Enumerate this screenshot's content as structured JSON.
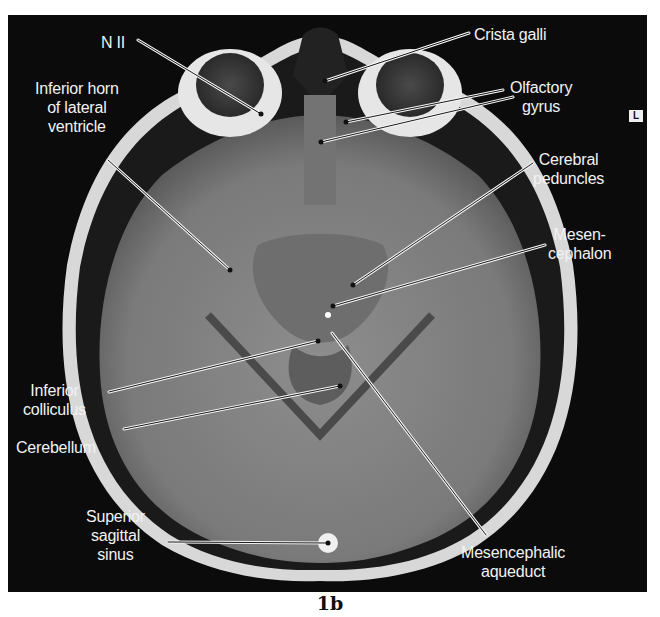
{
  "figure": {
    "caption": "1b",
    "orientation_marker": "L",
    "image_type": "axial MRI section of head"
  },
  "labels": [
    {
      "id": "n2",
      "text": "N II"
    },
    {
      "id": "crista-galli",
      "text": "Crista galli"
    },
    {
      "id": "inferior-horn",
      "text": "Inferior horn\nof lateral\nventricle"
    },
    {
      "id": "olfactory-gyrus",
      "text": "Olfactory\ngyrus"
    },
    {
      "id": "cerebral-peduncles",
      "text": "Cerebral\npeduncles"
    },
    {
      "id": "mesencephalon",
      "text": "Mesen-\ncephalon"
    },
    {
      "id": "inferior-colliculus",
      "text": "Inferior\ncolliculus"
    },
    {
      "id": "cerebellum",
      "text": "Cerebellum"
    },
    {
      "id": "superior-sagittal-sinus",
      "text": "Superior\nsagittal\nsinus"
    },
    {
      "id": "mesencephalic-aqueduct",
      "text": "Mesencephalic\naqueduct"
    }
  ],
  "colors": {
    "background": "#0b0b0b",
    "label_text": "#f2f2f2",
    "page": "#ffffff"
  }
}
